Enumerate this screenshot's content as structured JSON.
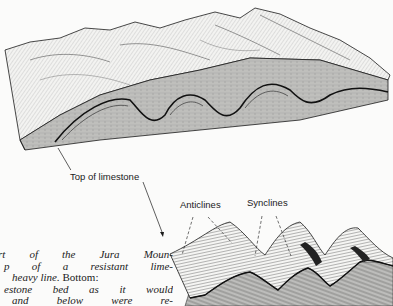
{
  "figure": {
    "top_diagram": {
      "description": "Block diagram of folded Jura Mountains terrain with cross-section showing anticlines and synclines",
      "label": "Top of limestone"
    },
    "bottom_diagram": {
      "description": "Folded limestone bed surface with overlying and underlying rocks removed",
      "labels": {
        "anticlines": "Anticlines",
        "synclines": "Synclines"
      }
    },
    "caption": {
      "lines": [
        "rt of the Jura Moun-",
        "p of a resistant lime-",
        "heavy line.",
        "Bottom:",
        "estone bed as it would",
        "and below were re-"
      ]
    }
  },
  "colors": {
    "paper": "#fbfbfa",
    "ink": "#1a1a1a",
    "shade": "#8a8a8a"
  }
}
